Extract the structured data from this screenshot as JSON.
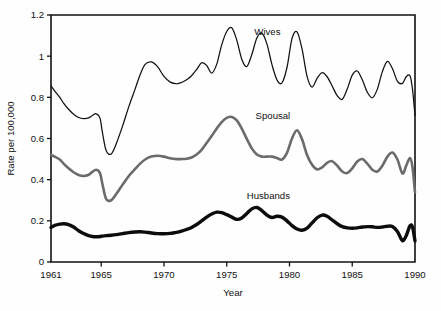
{
  "chart_data": {
    "type": "line",
    "title": "",
    "subtitle": "",
    "xlabel": "Year",
    "ylabel": "Rate per 100,000",
    "xlim": [
      1961,
      1990
    ],
    "ylim": [
      0,
      1.2
    ],
    "grid": false,
    "legend_position": "inline-annotations",
    "x_ticks": [
      1961,
      1965,
      1970,
      1975,
      1980,
      1985,
      1990
    ],
    "x_tick_labels": [
      "1961",
      "1965",
      "1970",
      "1975",
      "1980",
      "1985",
      "1990"
    ],
    "y_ticks": [
      0,
      0.2,
      0.4,
      0.6,
      0.8,
      1,
      1.2
    ],
    "y_tick_labels": [
      "0",
      "0.2",
      "0.4",
      "0.6",
      "0.8",
      "1",
      "1.2"
    ],
    "annotations": [
      {
        "text": "Wives",
        "x": 1977.2,
        "y": 1.105,
        "series": "Wives"
      },
      {
        "text": "Spousal",
        "x": 1977.3,
        "y": 0.695,
        "series": "Spousal"
      },
      {
        "text": "Husbands",
        "x": 1976.6,
        "y": 0.305,
        "series": "Husbands"
      }
    ],
    "x": [
      1961.0,
      1961.3,
      1961.7,
      1962.0,
      1962.4,
      1962.8,
      1963.2,
      1963.6,
      1964.0,
      1964.3,
      1964.6,
      1964.9,
      1965.1,
      1965.4,
      1965.8,
      1966.2,
      1966.7,
      1967.2,
      1967.7,
      1968.1,
      1968.5,
      1969.0,
      1969.5,
      1970.0,
      1970.5,
      1971.0,
      1971.4,
      1971.8,
      1972.2,
      1972.6,
      1973.0,
      1973.4,
      1973.8,
      1974.2,
      1974.6,
      1975.0,
      1975.4,
      1975.8,
      1976.2,
      1976.6,
      1977.0,
      1977.4,
      1977.8,
      1978.2,
      1978.6,
      1979.0,
      1979.4,
      1979.8,
      1980.2,
      1980.6,
      1981.0,
      1981.4,
      1981.8,
      1982.2,
      1982.6,
      1983.0,
      1983.4,
      1983.8,
      1984.2,
      1984.6,
      1985.0,
      1985.4,
      1985.8,
      1986.2,
      1986.6,
      1987.0,
      1987.4,
      1987.8,
      1988.2,
      1988.6,
      1989.0,
      1989.3,
      1989.6,
      1989.8,
      1990.0
    ],
    "series": [
      {
        "name": "Wives",
        "color": "#111111",
        "style": "thin-line",
        "values": [
          0.855,
          0.83,
          0.8,
          0.772,
          0.742,
          0.718,
          0.702,
          0.697,
          0.7,
          0.712,
          0.72,
          0.7,
          0.628,
          0.54,
          0.525,
          0.575,
          0.66,
          0.755,
          0.84,
          0.91,
          0.96,
          0.972,
          0.948,
          0.902,
          0.874,
          0.866,
          0.872,
          0.885,
          0.905,
          0.935,
          0.968,
          0.955,
          0.918,
          0.96,
          1.055,
          1.12,
          1.138,
          1.078,
          0.985,
          0.95,
          1.008,
          1.088,
          1.112,
          1.06,
          0.96,
          0.885,
          0.87,
          0.945,
          1.085,
          1.118,
          1.035,
          0.902,
          0.85,
          0.892,
          0.92,
          0.9,
          0.855,
          0.808,
          0.79,
          0.84,
          0.908,
          0.928,
          0.885,
          0.825,
          0.798,
          0.84,
          0.925,
          0.975,
          0.94,
          0.878,
          0.868,
          0.9,
          0.905,
          0.84,
          0.712
        ]
      },
      {
        "name": "Spousal",
        "color": "#6b6b6b",
        "style": "medium-gray-line",
        "values": [
          0.52,
          0.512,
          0.498,
          0.478,
          0.455,
          0.436,
          0.423,
          0.418,
          0.424,
          0.438,
          0.448,
          0.432,
          0.378,
          0.305,
          0.3,
          0.33,
          0.375,
          0.418,
          0.452,
          0.478,
          0.498,
          0.512,
          0.516,
          0.512,
          0.504,
          0.5,
          0.5,
          0.502,
          0.508,
          0.522,
          0.545,
          0.578,
          0.612,
          0.648,
          0.68,
          0.7,
          0.705,
          0.688,
          0.648,
          0.598,
          0.552,
          0.522,
          0.512,
          0.512,
          0.512,
          0.505,
          0.498,
          0.53,
          0.6,
          0.64,
          0.596,
          0.52,
          0.472,
          0.45,
          0.46,
          0.482,
          0.49,
          0.468,
          0.44,
          0.432,
          0.455,
          0.488,
          0.5,
          0.478,
          0.448,
          0.44,
          0.468,
          0.512,
          0.532,
          0.498,
          0.43,
          0.468,
          0.505,
          0.46,
          0.338
        ]
      },
      {
        "name": "Husbands",
        "color": "#0c0c0c",
        "style": "thick-line",
        "values": [
          0.168,
          0.178,
          0.184,
          0.186,
          0.182,
          0.17,
          0.152,
          0.138,
          0.128,
          0.124,
          0.123,
          0.124,
          0.126,
          0.128,
          0.13,
          0.133,
          0.138,
          0.143,
          0.146,
          0.147,
          0.145,
          0.141,
          0.138,
          0.137,
          0.139,
          0.144,
          0.15,
          0.158,
          0.168,
          0.182,
          0.2,
          0.218,
          0.233,
          0.242,
          0.24,
          0.23,
          0.218,
          0.207,
          0.214,
          0.236,
          0.258,
          0.265,
          0.25,
          0.228,
          0.216,
          0.222,
          0.218,
          0.2,
          0.177,
          0.16,
          0.154,
          0.164,
          0.19,
          0.215,
          0.228,
          0.222,
          0.204,
          0.186,
          0.172,
          0.166,
          0.164,
          0.166,
          0.17,
          0.172,
          0.171,
          0.168,
          0.17,
          0.174,
          0.172,
          0.148,
          0.104,
          0.128,
          0.176,
          0.17,
          0.102
        ]
      }
    ]
  },
  "plot": {
    "left": 51,
    "right": 415,
    "top": 15,
    "bottom": 262
  }
}
